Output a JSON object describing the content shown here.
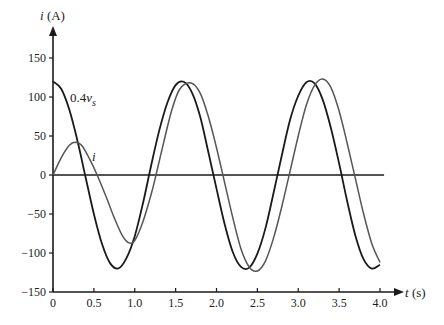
{
  "chart_data": {
    "type": "line",
    "title": "",
    "xlabel": "t (s)",
    "ylabel": "i (A)",
    "xlim": [
      0,
      4.0
    ],
    "ylim": [
      -150,
      150
    ],
    "grid": false,
    "legend": "inline labels",
    "x_ticks": [
      "0",
      "0.5",
      "1.0",
      "1.5",
      "2.0",
      "2.5",
      "3.0",
      "3.5",
      "4.0"
    ],
    "y_ticks": [
      "150",
      "100",
      "50",
      "0",
      "−50",
      "−100",
      "−150"
    ],
    "annotations": [
      {
        "text": "0.4v",
        "subscript": "s",
        "t": 0.22,
        "y": 97
      },
      {
        "text": "i",
        "t": 0.5,
        "y": 22
      }
    ],
    "series": [
      {
        "name": "0.4v_s",
        "color": "#1a1a1a",
        "formula": "120cos(4t)",
        "x": [
          0,
          0.1,
          0.2,
          0.3,
          0.4,
          0.5,
          0.6,
          0.7,
          0.8,
          0.9,
          1.0,
          1.1,
          1.2,
          1.3,
          1.4,
          1.5,
          1.6,
          1.7,
          1.8,
          1.9,
          2.0,
          2.1,
          2.2,
          2.3,
          2.4,
          2.5,
          2.6,
          2.7,
          2.8,
          2.9,
          3.0,
          3.1,
          3.2,
          3.3,
          3.4,
          3.5,
          3.6,
          3.7,
          3.8,
          3.9,
          4.0
        ],
        "values": [
          120,
          110.5,
          83.6,
          43.5,
          -3.5,
          -49.9,
          -88.5,
          -113.3,
          -119.7,
          -106.2,
          -78.4,
          -36.5,
          11.9,
          57.2,
          92.9,
          115.2,
          119.5,
          105.6,
          74.9,
          29.5,
          -17.5,
          -63.2,
          -99.1,
          -117.9,
          -118.8,
          -100.8,
          -67.8,
          -22.1,
          25.6,
          70.7,
          101.6,
          119.0,
          117.4,
          96.3,
          60.0,
          14.7,
          -34.3,
          -78.1,
          -108.2,
          -119.9,
          -115.1
        ]
      },
      {
        "name": "i",
        "color": "#555555",
        "x": [
          0,
          0.1,
          0.2,
          0.27,
          0.35,
          0.45,
          0.54,
          0.65,
          0.75,
          0.85,
          0.93,
          1.0,
          1.1,
          1.2,
          1.26,
          1.35,
          1.45,
          1.55,
          1.69,
          1.8,
          1.9,
          2.0,
          2.1,
          2.2,
          2.3,
          2.4,
          2.5,
          2.6,
          2.7,
          2.8,
          2.9,
          3.0,
          3.1,
          3.2,
          3.3,
          3.4,
          3.5,
          3.6,
          3.7,
          3.8,
          3.9,
          4.0
        ],
        "values": [
          0,
          22,
          38,
          42,
          38,
          20,
          0,
          -28,
          -55,
          -78,
          -87,
          -84,
          -60,
          -25,
          0,
          40,
          82,
          110,
          118,
          105,
          75,
          35,
          -10,
          -55,
          -95,
          -118,
          -123,
          -110,
          -80,
          -40,
          5,
          50,
          90,
          115,
          123,
          112,
          82,
          40,
          -5,
          -50,
          -88,
          -112
        ]
      }
    ]
  }
}
